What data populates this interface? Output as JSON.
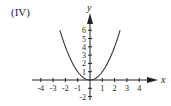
{
  "panel": {
    "label": "(IV)"
  },
  "chart_data": {
    "type": "line",
    "title": "(IV)",
    "xlabel": "x",
    "ylabel": "y",
    "function": "y = x^2",
    "xlim": [
      -4.5,
      5
    ],
    "ylim": [
      -2.3,
      7.5
    ],
    "x_ticks": [
      -4,
      -3,
      -2,
      -1,
      1,
      2,
      3,
      4
    ],
    "x_tick_labels": [
      "-4",
      "-3",
      "-2",
      "-1",
      "1",
      "2",
      "3",
      "4"
    ],
    "y_ticks": [
      -2,
      -1,
      1,
      2,
      3,
      4,
      5,
      6
    ],
    "y_tick_labels": [
      "-2",
      "1",
      "2",
      "3",
      "4",
      "5",
      "6"
    ],
    "grid": false,
    "legend": null,
    "series": [
      {
        "name": "parabola",
        "x": [
          -2.45,
          -2,
          -1.5,
          -1,
          -0.5,
          0,
          0.5,
          1,
          1.5,
          2,
          2.45
        ],
        "y": [
          6.0,
          4,
          2.25,
          1,
          0.25,
          0,
          0.25,
          1,
          2.25,
          4,
          6.0
        ]
      }
    ],
    "colors": {
      "axis": "#222222",
      "curve": "#333333"
    }
  }
}
